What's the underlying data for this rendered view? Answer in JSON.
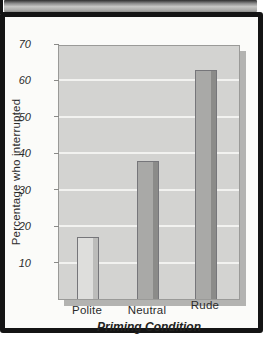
{
  "figure": {
    "xaxis_title": "Priming Condition",
    "yaxis_title": "Percentage who interrupted"
  },
  "chart_data": {
    "type": "bar",
    "categories": [
      "Polite",
      "Neutral",
      "Rude"
    ],
    "values": [
      17,
      38,
      63
    ],
    "title": "",
    "xlabel": "Priming Condition",
    "ylabel": "Percentage who interrupted",
    "ylim": [
      0,
      70
    ],
    "yticks": [
      70,
      60,
      50,
      40,
      30,
      20,
      10
    ],
    "grid": "horizontal-white-lines",
    "legend": "none",
    "plot_background": "#d3d3d1",
    "gridline_color": "#f2f2f0",
    "bar_fill_colors": [
      "#dededc",
      "#a9a9a7",
      "#a9a9a7"
    ],
    "bar_shade_colors": [
      "#bcbcba",
      "#8b8b89",
      "#8b8b89"
    ],
    "frame_color": "#141414"
  }
}
